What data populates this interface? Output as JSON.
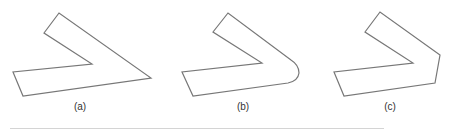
{
  "figure": {
    "stroke_color": "#777777",
    "panels": [
      {
        "id": "a",
        "label": "(a)",
        "join": "miter",
        "points": "59,13 44,33 92,64 13,72 23,96 151,78"
      },
      {
        "id": "b",
        "label": "(b)",
        "join": "round",
        "path": "M228,13 L213,32 L262,63 L182,72 L193,96 L288,83 Q298,81 299,73 Q299,65 291,60 Z"
      },
      {
        "id": "c",
        "label": "(c)",
        "join": "bevel",
        "points": "380,12 365,32 413,63 334,72 344,96 435,83 440,55"
      }
    ]
  }
}
